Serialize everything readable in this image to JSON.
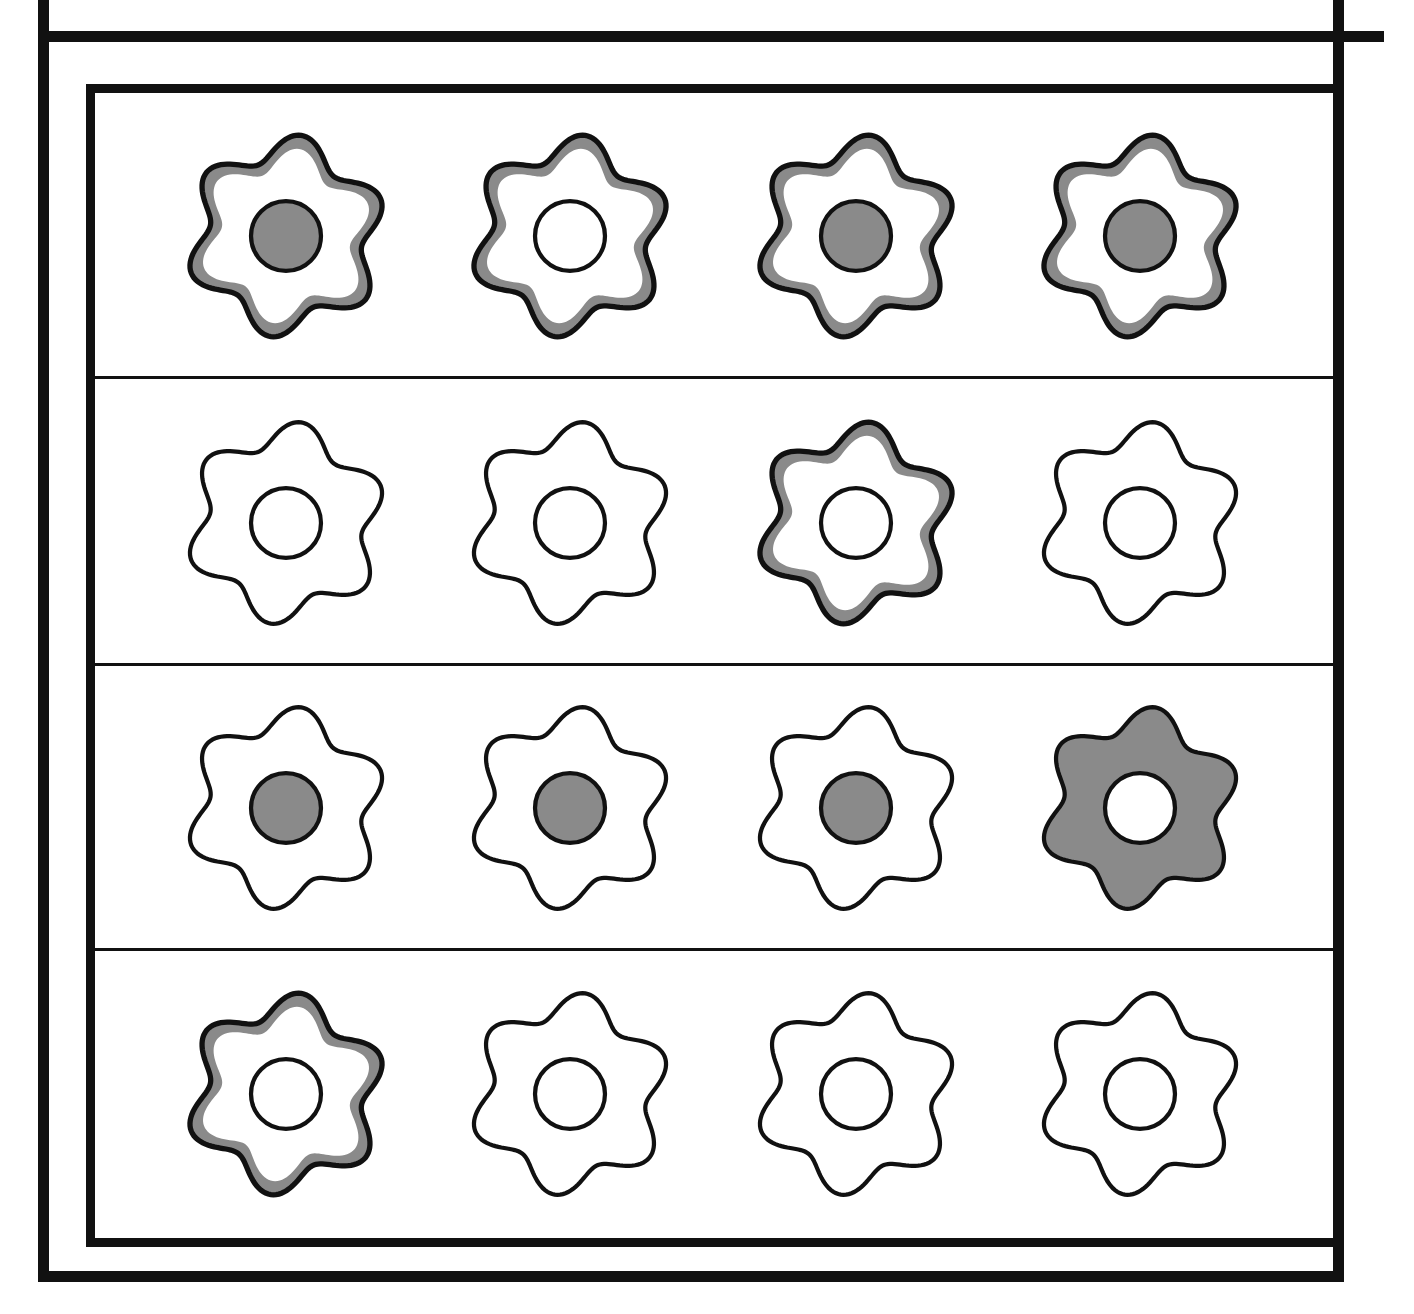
{
  "colors": {
    "ink": "#111111",
    "grey": "#8a8a8a",
    "paper": "#ffffff"
  },
  "grid": {
    "rows": 4,
    "cols": 4,
    "row_tops": [
      0,
      287,
      572,
      858
    ],
    "row_height": 286,
    "col_centers": [
      191,
      475,
      761,
      1045
    ],
    "items": [
      [
        {
          "petals": "banded",
          "center": "filled"
        },
        {
          "petals": "banded",
          "center": "empty"
        },
        {
          "petals": "banded",
          "center": "filled"
        },
        {
          "petals": "banded",
          "center": "filled"
        }
      ],
      [
        {
          "petals": "plain",
          "center": "empty"
        },
        {
          "petals": "plain",
          "center": "empty"
        },
        {
          "petals": "banded",
          "center": "empty"
        },
        {
          "petals": "plain",
          "center": "empty"
        }
      ],
      [
        {
          "petals": "plain",
          "center": "filled"
        },
        {
          "petals": "plain",
          "center": "filled"
        },
        {
          "petals": "plain",
          "center": "filled"
        },
        {
          "petals": "solid",
          "center": "empty"
        }
      ],
      [
        {
          "petals": "banded",
          "center": "empty"
        },
        {
          "petals": "plain",
          "center": "empty"
        },
        {
          "petals": "plain",
          "center": "empty"
        },
        {
          "petals": "plain",
          "center": "empty"
        }
      ]
    ]
  }
}
